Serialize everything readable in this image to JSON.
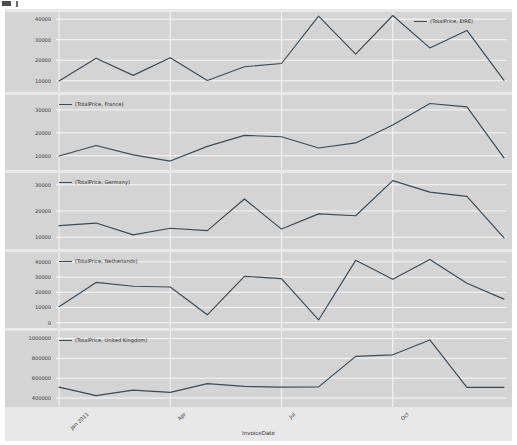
{
  "figure": {
    "background_color": "#e8e8e8",
    "panel_color": "#d4d4d4",
    "grid_color": "#f7f7f7",
    "line_color": "#3c4a54"
  },
  "axis": {
    "xlabel": "InvoiceDate",
    "xticks": [
      "Jan 2011",
      "Apr",
      "Jul",
      "Oct"
    ],
    "xtick_positions": [
      0,
      3,
      6,
      9
    ]
  },
  "chart_data": {
    "type": "line",
    "title": "",
    "xlabel": "InvoiceDate",
    "ylabel": "",
    "grid": true,
    "legend_position": "inside-panel",
    "x": [
      "Jan 2011",
      "Feb",
      "Mar",
      "Apr",
      "May",
      "Jun",
      "Jul",
      "Aug",
      "Sep",
      "Oct",
      "Nov",
      "Dec",
      "Jan 2012"
    ],
    "panels": [
      {
        "name": "EIRE",
        "legend": "(TotalPrice, EIRE)",
        "yticks": [
          10000,
          20000,
          30000,
          40000
        ],
        "ylim": [
          4500,
          43500
        ],
        "values": [
          9900,
          21000,
          12600,
          21200,
          10100,
          16800,
          18400,
          41500,
          23000,
          41800,
          26000,
          34500,
          10200
        ]
      },
      {
        "name": "France",
        "legend": "(TotalPrice, France)",
        "yticks": [
          10000,
          20000,
          30000
        ],
        "ylim": [
          3800,
          36500
        ],
        "values": [
          9900,
          14500,
          10400,
          7700,
          14100,
          18900,
          18300,
          13400,
          15600,
          23400,
          32800,
          31300,
          9100
        ]
      },
      {
        "name": "Germany",
        "legend": "(TotalPrice, Germany)",
        "yticks": [
          10000,
          20000,
          30000
        ],
        "ylim": [
          5500,
          34500
        ],
        "values": [
          14400,
          15400,
          10900,
          13400,
          12500,
          24600,
          13100,
          18900,
          18200,
          31600,
          27200,
          25600,
          9700
        ]
      },
      {
        "name": "Netherlands",
        "legend": "(TotalPrice, Netherlands)",
        "yticks": [
          0,
          10000,
          20000,
          30000,
          40000
        ],
        "ylim": [
          -3500,
          46500
        ],
        "values": [
          10500,
          26500,
          24000,
          23500,
          5200,
          30500,
          29000,
          1800,
          41000,
          28500,
          41500,
          26000,
          15500
        ]
      },
      {
        "name": "United Kingdom",
        "legend": "(TotalPrice, United Kingdom)",
        "yticks": [
          400000,
          600000,
          800000,
          1000000
        ],
        "ylim": [
          310000,
          1075000
        ],
        "values": [
          510000,
          424000,
          480000,
          457000,
          545000,
          517000,
          510000,
          512000,
          820000,
          835000,
          985000,
          508000,
          508000
        ]
      }
    ]
  }
}
